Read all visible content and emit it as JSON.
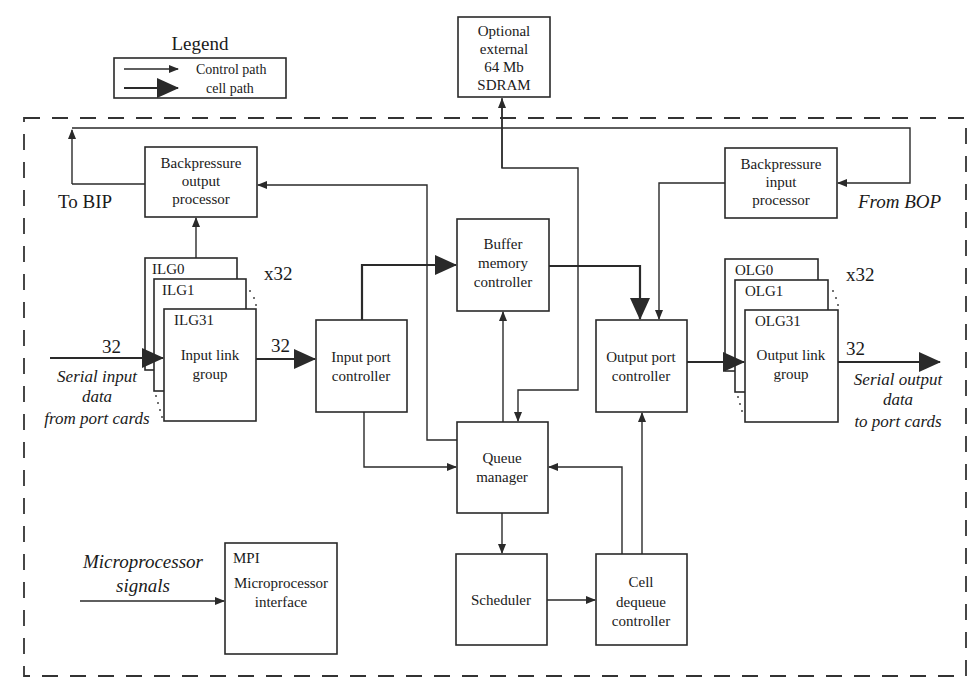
{
  "legend": {
    "title": "Legend",
    "items": [
      {
        "label": "Control path",
        "style": "thin-arrow"
      },
      {
        "label": "cell path",
        "style": "thick-arrow"
      }
    ]
  },
  "blocks": {
    "sdram": {
      "lines": [
        "Optional",
        "external",
        "64 Mb",
        "SDRAM"
      ]
    },
    "bop": {
      "lines": [
        "Backpressure",
        "output",
        "processor"
      ]
    },
    "bip": {
      "lines": [
        "Backpressure",
        "input",
        "processor"
      ]
    },
    "bmc": {
      "lines": [
        "Buffer",
        "memory",
        "controller"
      ]
    },
    "ilg": {
      "stack_labels": [
        "ILG0",
        "ILG1",
        "ILG31"
      ],
      "lines": [
        "Input link",
        "group"
      ],
      "multiplier": "x32"
    },
    "olg": {
      "stack_labels": [
        "OLG0",
        "OLG1",
        "OLG31"
      ],
      "lines": [
        "Output link",
        "group"
      ],
      "multiplier": "x32"
    },
    "ipc": {
      "lines": [
        "Input port",
        "controller"
      ]
    },
    "opc": {
      "lines": [
        "Output port",
        "controller"
      ]
    },
    "qm": {
      "lines": [
        "Queue",
        "manager"
      ]
    },
    "sched": {
      "lines": [
        "Scheduler"
      ]
    },
    "cdc": {
      "lines": [
        "Cell",
        "dequeue",
        "controller"
      ]
    },
    "mpi": {
      "tag": "MPI",
      "lines": [
        "Microprocessor",
        "interface"
      ]
    }
  },
  "external_labels": {
    "to_bip": "To BIP",
    "from_bop": "From BOP",
    "serial_in": [
      "Serial input",
      "data",
      "from port cards"
    ],
    "serial_out": [
      "Serial output",
      "data",
      "to port cards"
    ],
    "micro_signals": [
      "Microprocessor",
      "signals"
    ]
  },
  "bus_widths": {
    "in_serial": "32",
    "ilg_to_ipc": "32",
    "out_serial": "32"
  }
}
